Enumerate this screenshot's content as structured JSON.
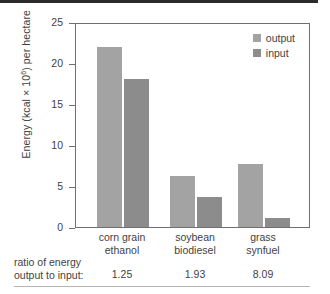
{
  "chart_data": {
    "type": "bar",
    "title": "",
    "xlabel": "",
    "ylabel": "Energy (kcal × 10⁶) per hectare",
    "ylabel_main": "Energy (kcal × 10",
    "ylabel_exp": "6",
    "ylabel_tail": ") per hectare",
    "ylim": [
      0,
      25
    ],
    "yticks": [
      0,
      5,
      10,
      15,
      20,
      25
    ],
    "ytick_labels": [
      "0",
      "5",
      "10",
      "15",
      "20",
      "25"
    ],
    "grid": false,
    "legend_position": "top-right",
    "categories": [
      "corn grain ethanol",
      "soybean biodiesel",
      "grass synfuel"
    ],
    "category_lines": [
      {
        "line1": "corn grain",
        "line2": "ethanol"
      },
      {
        "line1": "soybean",
        "line2": "biodiesel"
      },
      {
        "line1": "grass",
        "line2": "synfuel"
      }
    ],
    "series": [
      {
        "name": "output",
        "color": "#a3a3a3",
        "values": [
          22.0,
          6.2,
          7.7
        ]
      },
      {
        "name": "input",
        "color": "#8c8c8c",
        "values": [
          18.0,
          3.7,
          1.05
        ]
      }
    ],
    "annotations": {
      "ratio_caption_line1": "ratio of energy",
      "ratio_caption_line2": "output to input:",
      "ratio_values": [
        "1.25",
        "1.93",
        "8.09"
      ]
    }
  },
  "legend": {
    "items": [
      {
        "label": "output",
        "color": "#a3a3a3"
      },
      {
        "label": "input",
        "color": "#8c8c8c"
      }
    ]
  },
  "axis": {
    "frame_color": "#6f6f6f"
  }
}
